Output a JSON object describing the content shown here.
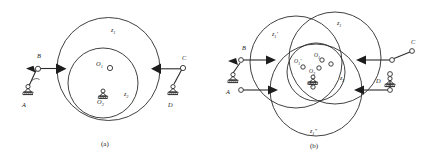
{
  "figure": {
    "type": "mechanism-kinematic-diagram",
    "panels": [
      {
        "id": "a",
        "caption": "(a)",
        "labels": {
          "outer_wheel": "z",
          "outer_wheel_sub": "1",
          "inner_wheel": "z",
          "inner_wheel_sub": "2",
          "center_upper": "O",
          "center_upper_sub": "1",
          "center_lower": "O",
          "center_lower_sub": "2",
          "support_left": "A",
          "joint_left": "B",
          "joint_right": "C",
          "support_right": "D"
        }
      },
      {
        "id": "b",
        "caption": "(b)",
        "labels": {
          "wheel_top_right": "z",
          "wheel_top_right_sub": "1",
          "wheel_top_left": "z",
          "wheel_top_left_sub": "1",
          "wheel_top_left_prime": "'",
          "wheel_bottom": "z",
          "wheel_bottom_sub": "1",
          "wheel_bottom_prime": "\"",
          "inner_wheel": "z",
          "inner_wheel_sub": "2",
          "center_left": "O",
          "center_left_sub": "1",
          "center_left_prime": "'",
          "center_top": "O",
          "center_top_sub": "1",
          "center_main": "O",
          "center_main_sub": "3",
          "center_bottom": "O",
          "center_bottom_sub": "1",
          "center_bottom_prime": "\"",
          "support_left": "A",
          "joint_left": "B",
          "joint_right": "C",
          "support_right": "D"
        }
      }
    ],
    "colors": {
      "ink": "#2b2b2b",
      "fill": "#ffffff",
      "arrow": "#1d1d1d"
    }
  }
}
